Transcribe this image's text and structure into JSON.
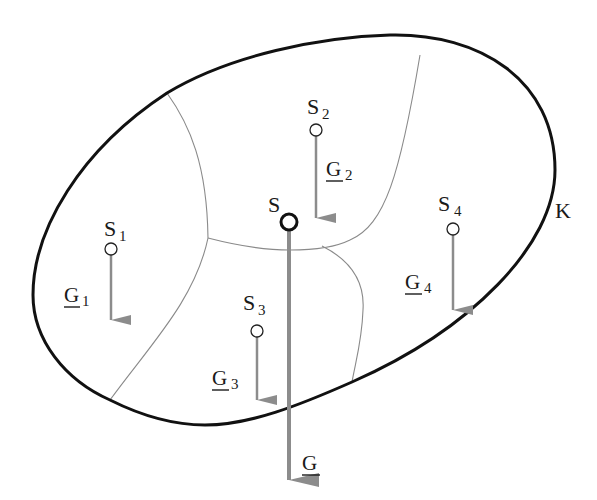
{
  "diagram": {
    "type": "center-of-gravity composite body",
    "body_label": "K",
    "colors": {
      "outline": "#111111",
      "division_lines": "#8a8a8a",
      "arrows": "#8c8c8c",
      "point_stroke": "#222222",
      "background": "#ffffff"
    },
    "overall": {
      "point": {
        "name": "S",
        "label": "S"
      },
      "force": {
        "name": "G",
        "label": "G",
        "underlined": true
      }
    },
    "parts": [
      {
        "point": {
          "label": "S",
          "sub": "1"
        },
        "force": {
          "label": "G",
          "sub": "1",
          "underlined": true
        }
      },
      {
        "point": {
          "label": "S",
          "sub": "2"
        },
        "force": {
          "label": "G",
          "sub": "2",
          "underlined": true
        }
      },
      {
        "point": {
          "label": "S",
          "sub": "3"
        },
        "force": {
          "label": "G",
          "sub": "3",
          "underlined": true
        }
      },
      {
        "point": {
          "label": "S",
          "sub": "4"
        },
        "force": {
          "label": "G",
          "sub": "4",
          "underlined": true
        }
      }
    ]
  }
}
